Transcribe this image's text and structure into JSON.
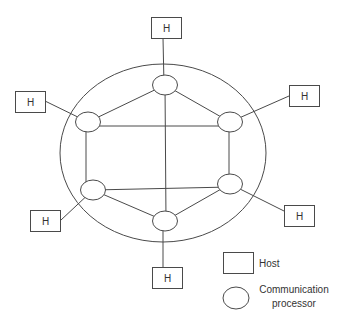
{
  "diagram": {
    "type": "network-topology",
    "subnet_boundary": {
      "cx": 163,
      "cy": 153,
      "rx": 103,
      "ry": 89
    },
    "processors": [
      {
        "id": "p-top",
        "cx": 165,
        "cy": 85
      },
      {
        "id": "p-left-top",
        "cx": 88,
        "cy": 122
      },
      {
        "id": "p-right-top",
        "cx": 230,
        "cy": 122
      },
      {
        "id": "p-left-bottom",
        "cx": 93,
        "cy": 190
      },
      {
        "id": "p-right-bottom",
        "cx": 230,
        "cy": 184
      },
      {
        "id": "p-bottom",
        "cx": 165,
        "cy": 221
      }
    ],
    "hosts": [
      {
        "id": "h-top",
        "label": "H",
        "x": 151,
        "y": 17,
        "attached_to": "p-top"
      },
      {
        "id": "h-left-top",
        "label": "H",
        "x": 15,
        "y": 91,
        "attached_to": "p-left-top"
      },
      {
        "id": "h-right-top",
        "label": "H",
        "x": 289,
        "y": 85,
        "attached_to": "p-right-top"
      },
      {
        "id": "h-left-bottom",
        "label": "H",
        "x": 30,
        "y": 210,
        "attached_to": "p-left-bottom"
      },
      {
        "id": "h-right-bottom",
        "label": "H",
        "x": 284,
        "y": 205,
        "attached_to": "p-right-bottom"
      },
      {
        "id": "h-bottom",
        "label": "H",
        "x": 152,
        "y": 267,
        "attached_to": "p-bottom"
      }
    ],
    "links": [
      [
        "p-top",
        "p-left-top"
      ],
      [
        "p-top",
        "p-right-top"
      ],
      [
        "p-top",
        "p-bottom"
      ],
      [
        "p-left-top",
        "p-right-top"
      ],
      [
        "p-left-top",
        "p-left-bottom"
      ],
      [
        "p-right-top",
        "p-right-bottom"
      ],
      [
        "p-left-bottom",
        "p-right-bottom"
      ],
      [
        "p-left-bottom",
        "p-bottom"
      ],
      [
        "p-right-bottom",
        "p-bottom"
      ]
    ]
  },
  "legend": {
    "host_label": "Host",
    "processor_label_line1": "Communication",
    "processor_label_line2": "processor"
  }
}
